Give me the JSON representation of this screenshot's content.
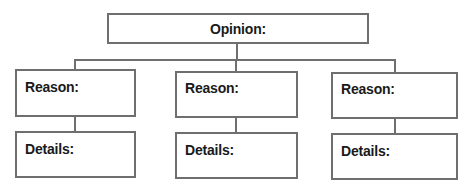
{
  "diagram": {
    "type": "graphic-organizer",
    "line_color": "#6f6f6f",
    "text_color": "#1a1a1a",
    "root": {
      "label": "Opinion:"
    },
    "branches": [
      {
        "reason_label": "Reason:",
        "details_label": "Details:"
      },
      {
        "reason_label": "Reason:",
        "details_label": "Details:"
      },
      {
        "reason_label": "Reason:",
        "details_label": "Details:"
      }
    ]
  }
}
